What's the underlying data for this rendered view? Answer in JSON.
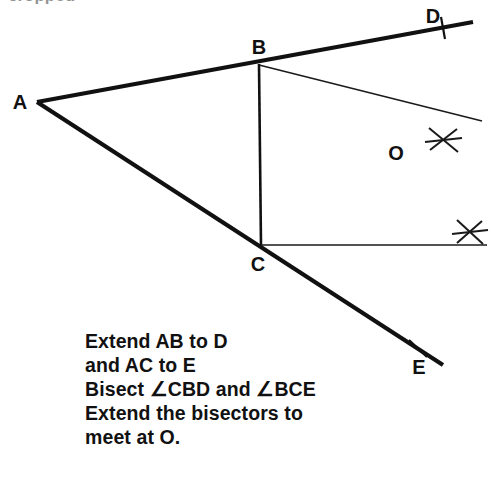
{
  "figure": {
    "background_color": "#ffffff",
    "ink_color": "#111111",
    "vertices": [
      {
        "name": "A",
        "label": "A",
        "x": 37,
        "y": 102,
        "label_x": 20,
        "label_y": 108
      },
      {
        "name": "B",
        "label": "B",
        "x": 259,
        "y": 64,
        "label_x": 259,
        "label_y": 53
      },
      {
        "name": "C",
        "label": "C",
        "x": 261,
        "y": 245,
        "label_x": 258,
        "label_y": 270
      },
      {
        "name": "D",
        "label": "D",
        "x": 443,
        "y": 28,
        "label_x": 433,
        "label_y": 22
      },
      {
        "name": "E",
        "label": "E",
        "x": 418,
        "y": 348,
        "label_x": 419,
        "label_y": 373
      },
      {
        "name": "O",
        "label": "O",
        "x": 393,
        "y": 173,
        "label_x": 395,
        "label_y": 159
      }
    ],
    "segments": [
      {
        "name": "ray-AB-to-D",
        "x1": 37,
        "y1": 102,
        "x2": 473,
        "y2": 22,
        "weight": "thick"
      },
      {
        "name": "ray-AC-to-E",
        "x1": 37,
        "y1": 102,
        "x2": 443,
        "y2": 365,
        "weight": "thick"
      },
      {
        "name": "segment-BC",
        "x1": 259,
        "y1": 64,
        "x2": 261,
        "y2": 246,
        "weight": "medium"
      },
      {
        "name": "bisector-from-B",
        "x1": 259,
        "y1": 65,
        "x2": 482,
        "y2": 121,
        "weight": "thin"
      },
      {
        "name": "bisector-from-C",
        "x1": 261,
        "y1": 245,
        "x2": 487,
        "y2": 245,
        "weight": "thin"
      }
    ],
    "tick_marks": [
      {
        "name": "tick-at-D",
        "cx": 443,
        "cy": 28,
        "style": "vertical",
        "length": 22,
        "angle": -8
      },
      {
        "name": "tick-at-E",
        "cx": 418,
        "cy": 348,
        "style": "cross",
        "length": 22,
        "angle": 28
      }
    ],
    "arc_crosses": [
      {
        "name": "arc-cross-upper",
        "cx": 443,
        "cy": 140,
        "size": 15
      },
      {
        "name": "arc-cross-lower",
        "cx": 470,
        "cy": 232,
        "size": 15
      }
    ]
  },
  "caption": {
    "x": 85,
    "start_y": 348,
    "line_height": 24,
    "lines": [
      "Extend AB to D",
      "and AC to E",
      "Bisect ∠CBD and ∠BCE",
      "Extend the bisectors to",
      "meet at O."
    ]
  },
  "artifact": {
    "text": "cropped"
  }
}
